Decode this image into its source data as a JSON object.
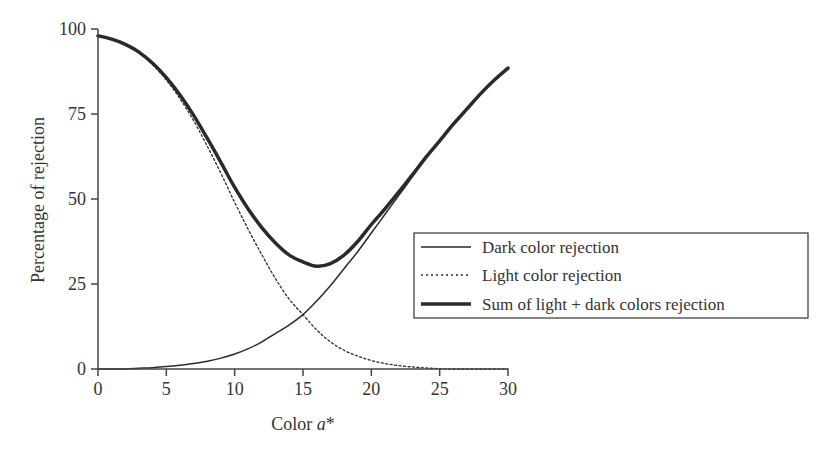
{
  "chart_data": {
    "type": "line",
    "title": "",
    "xlabel": "Color a*",
    "xlabel_parts": {
      "prefix": "Color ",
      "italic": "a",
      "suffix": "*"
    },
    "ylabel": "Percentage of rejection",
    "xlim": [
      0,
      30
    ],
    "ylim": [
      0,
      100
    ],
    "xticks": [
      0,
      5,
      10,
      15,
      20,
      25,
      30
    ],
    "yticks": [
      0,
      25,
      50,
      75,
      100
    ],
    "grid": false,
    "legend_position": "center-right",
    "x": [
      0,
      1,
      2,
      3,
      4,
      5,
      6,
      7,
      8,
      9,
      10,
      11,
      12,
      13,
      14,
      15,
      16,
      17,
      18,
      19,
      20,
      21,
      22,
      23,
      24,
      25,
      26,
      27,
      28,
      29,
      30
    ],
    "series": [
      {
        "name": "Dark color rejection",
        "style": "solid-thin",
        "values": [
          0,
          0,
          0,
          0.2,
          0.4,
          0.7,
          1.1,
          1.6,
          2.3,
          3.2,
          4.4,
          6.0,
          8.0,
          10.5,
          13.0,
          16.0,
          20.0,
          24.5,
          29.5,
          34.5,
          40.0,
          45.5,
          51.0,
          56.5,
          62.0,
          67.0,
          72.0,
          76.5,
          81.0,
          85.0,
          88.5
        ]
      },
      {
        "name": "Light color rejection",
        "style": "dotted",
        "values": [
          98.0,
          97.0,
          95.5,
          93.0,
          89.5,
          85.0,
          79.5,
          73.0,
          65.5,
          57.5,
          49.0,
          41.0,
          33.5,
          26.5,
          20.5,
          16.0,
          11.5,
          8.0,
          5.5,
          3.8,
          2.5,
          1.6,
          1.0,
          0.6,
          0.3,
          0.1,
          0,
          0,
          0,
          0,
          0
        ]
      },
      {
        "name": "Sum of light + dark colors rejection",
        "style": "solid-thick",
        "values": [
          98.0,
          97.0,
          95.5,
          93.2,
          89.9,
          85.7,
          80.6,
          74.6,
          67.8,
          60.7,
          53.4,
          47.0,
          41.5,
          37.0,
          33.5,
          31.5,
          30.2,
          31.0,
          33.5,
          37.5,
          42.5,
          47.1,
          52.0,
          57.1,
          62.3,
          67.1,
          72.0,
          76.5,
          81.0,
          85.0,
          88.5
        ]
      }
    ]
  },
  "legend": {
    "items": [
      {
        "label": "Dark color rejection"
      },
      {
        "label": "Light color rejection"
      },
      {
        "label": "Sum of light + dark colors rejection"
      }
    ]
  },
  "colors": {
    "line": "#2a2a2a",
    "axis": "#444444",
    "background": "#ffffff"
  }
}
